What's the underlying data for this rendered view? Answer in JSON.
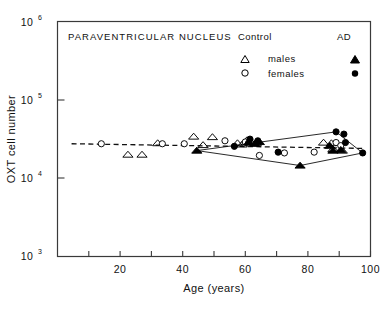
{
  "figure": {
    "plot_title": "PARAVENTRICULAR NUCLEUS",
    "y_axis_label": "OXT cell number",
    "x_axis_label": "Age (years)"
  },
  "legend": {
    "group_control": "Control",
    "group_ad": "AD",
    "row_males": "males",
    "row_females": "females",
    "control_males_marker": "open-triangle",
    "control_females_marker": "open-circle",
    "ad_males_marker": "filled-triangle",
    "ad_females_marker": "filled-circle"
  },
  "colors": {
    "ink": "#111111",
    "axis": "#3a3a3a",
    "marker": "#000000"
  },
  "chart_data": {
    "type": "scatter",
    "title": "PARAVENTRICULAR NUCLEUS",
    "xlabel": "Age (years)",
    "ylabel": "OXT cell number",
    "xlim": [
      0,
      100
    ],
    "ylim": [
      1000,
      1000000
    ],
    "yscale": "log",
    "grid": false,
    "legend_position": "top-right",
    "xticks": [
      0,
      10,
      20,
      30,
      40,
      50,
      60,
      70,
      80,
      90,
      100
    ],
    "xtick_labels": [
      "",
      "",
      "20",
      "",
      "40",
      "",
      "60",
      "",
      "80",
      "",
      "100"
    ],
    "yticks": [
      1000,
      10000,
      100000,
      1000000
    ],
    "ytick_labels": [
      "10^3",
      "10^4",
      "10^5",
      "10^6"
    ],
    "series": [
      {
        "name": "Control males",
        "marker": "open-triangle",
        "points": [
          [
            22.5,
            20000
          ],
          [
            27.0,
            20000
          ],
          [
            32.0,
            28000
          ],
          [
            43.5,
            34000
          ],
          [
            46.5,
            26500
          ],
          [
            49.5,
            33500
          ],
          [
            57.5,
            28000
          ],
          [
            59.0,
            27000
          ],
          [
            60.5,
            30500
          ],
          [
            62.0,
            28500
          ],
          [
            63.5,
            28000
          ],
          [
            85.0,
            28500
          ],
          [
            87.5,
            28000
          ],
          [
            88.0,
            23500
          ],
          [
            91.0,
            22500
          ]
        ]
      },
      {
        "name": "Control females",
        "marker": "open-circle",
        "points": [
          [
            14.0,
            27500
          ],
          [
            33.5,
            27500
          ],
          [
            40.5,
            27500
          ],
          [
            53.5,
            30000
          ],
          [
            60.0,
            29000
          ],
          [
            61.0,
            28000
          ],
          [
            64.5,
            19500
          ],
          [
            72.5,
            21000
          ],
          [
            82.0,
            21500
          ],
          [
            89.0,
            28500
          ],
          [
            90.5,
            26000
          ]
        ]
      },
      {
        "name": "AD males",
        "marker": "filled-triangle",
        "points": [
          [
            44.5,
            22500
          ],
          [
            61.0,
            28500
          ],
          [
            63.0,
            27500
          ],
          [
            64.5,
            29000
          ],
          [
            77.5,
            14500
          ],
          [
            87.0,
            26000
          ],
          [
            88.0,
            22500
          ],
          [
            90.5,
            23000
          ]
        ]
      },
      {
        "name": "AD females",
        "marker": "filled-circle",
        "points": [
          [
            56.5,
            25500
          ],
          [
            61.5,
            31500
          ],
          [
            64.0,
            30000
          ],
          [
            70.5,
            21500
          ],
          [
            89.0,
            39000
          ],
          [
            91.5,
            36500
          ],
          [
            92.0,
            28500
          ],
          [
            97.5,
            21000
          ]
        ]
      }
    ],
    "annotations": [
      {
        "name": "regression-line-dashed",
        "style": "dashed",
        "x": [
          4.5,
          97.5
        ],
        "y": [
          27500,
          24000
        ],
        "description": "dashed regression trend line across full age range"
      },
      {
        "name": "range-envelope-upper",
        "style": "solid",
        "x": [
          44.5,
          89.0,
          97.5
        ],
        "y": [
          22500,
          39000,
          21000
        ],
        "description": "upper boundary of AD data envelope"
      },
      {
        "name": "range-envelope-lower",
        "style": "solid",
        "x": [
          44.5,
          77.5,
          97.5
        ],
        "y": [
          22500,
          14500,
          21000
        ],
        "description": "lower boundary of AD data envelope"
      }
    ]
  }
}
